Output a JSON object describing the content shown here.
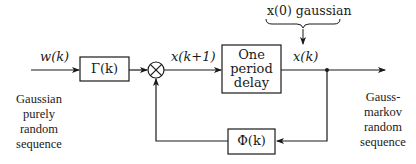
{
  "diagram": {
    "type": "block-diagram",
    "title": "",
    "input": {
      "signal_label": "w(k)",
      "caption_lines": [
        "Gaussian",
        "purely",
        "random",
        "sequence"
      ]
    },
    "blocks": [
      {
        "id": "gamma",
        "label": "Γ(k)"
      },
      {
        "id": "delay",
        "label_lines": [
          "One",
          "period",
          "delay"
        ]
      },
      {
        "id": "phi",
        "label": "Φ(k)"
      }
    ],
    "summing_junction": {
      "symbol": "⊗"
    },
    "signals": {
      "sum_output": "x(k+1)",
      "delay_output": "x(k)"
    },
    "initial_condition": {
      "label": "x(0)  gaussian"
    },
    "output": {
      "caption_lines": [
        "Gauss-",
        "markov",
        "random",
        "sequence"
      ]
    },
    "colors": {
      "ink": "#1a1a1a",
      "background": "#ffffff"
    }
  }
}
